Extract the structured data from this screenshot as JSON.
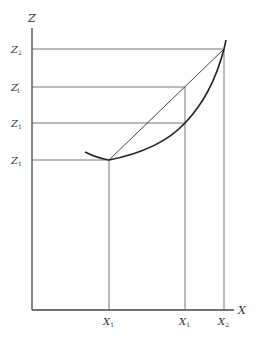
{
  "axes": {
    "z_label": "Z",
    "x_label": "X"
  },
  "z_ticks": [
    {
      "label": "Z",
      "sub": "2",
      "prime": "",
      "y": 49
    },
    {
      "label": "Z",
      "sub": "1",
      "prime": "′",
      "y": 87
    },
    {
      "label": "Z",
      "sub": "1",
      "prime": "",
      "y": 123
    },
    {
      "label": "Z",
      "sub": "1",
      "prime": "",
      "y": 160
    }
  ],
  "x_ticks": [
    {
      "label": "X",
      "sub": "1",
      "x": 109
    },
    {
      "label": "X",
      "sub": "1",
      "x": 185
    },
    {
      "label": "X",
      "sub": "2",
      "x": 224
    }
  ],
  "colors": {
    "line": "#555555",
    "curve": "#222222",
    "text": "#333333"
  }
}
